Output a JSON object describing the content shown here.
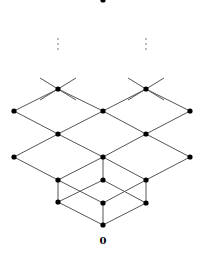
{
  "diagram": {
    "type": "hasse-lattice",
    "bottom_label": "0",
    "nodes": [
      {
        "id": "top",
        "x": 103,
        "y": 0
      },
      {
        "id": "a1",
        "x": 58,
        "y": 89
      },
      {
        "id": "a2",
        "x": 146,
        "y": 89
      },
      {
        "id": "b1",
        "x": 14,
        "y": 111
      },
      {
        "id": "b2",
        "x": 103,
        "y": 111
      },
      {
        "id": "b3",
        "x": 190,
        "y": 111
      },
      {
        "id": "c1",
        "x": 58,
        "y": 134
      },
      {
        "id": "c2",
        "x": 146,
        "y": 134
      },
      {
        "id": "d1",
        "x": 14,
        "y": 157
      },
      {
        "id": "d2",
        "x": 103,
        "y": 157
      },
      {
        "id": "d3",
        "x": 190,
        "y": 157
      },
      {
        "id": "e1",
        "x": 58,
        "y": 180
      },
      {
        "id": "e2",
        "x": 103,
        "y": 180
      },
      {
        "id": "e3",
        "x": 146,
        "y": 180
      },
      {
        "id": "f1",
        "x": 58,
        "y": 202
      },
      {
        "id": "f2",
        "x": 103,
        "y": 203
      },
      {
        "id": "f3",
        "x": 146,
        "y": 203
      },
      {
        "id": "zero",
        "x": 103,
        "y": 225
      }
    ],
    "edges": [
      [
        40,
        78,
        76,
        100
      ],
      [
        76,
        78,
        40,
        100
      ],
      [
        128,
        78,
        164,
        100
      ],
      [
        164,
        78,
        128,
        100
      ],
      [
        58,
        89,
        14,
        111
      ],
      [
        58,
        89,
        103,
        111
      ],
      [
        146,
        89,
        103,
        111
      ],
      [
        146,
        89,
        190,
        111
      ],
      [
        14,
        111,
        58,
        134
      ],
      [
        103,
        111,
        58,
        134
      ],
      [
        103,
        111,
        146,
        134
      ],
      [
        190,
        111,
        146,
        134
      ],
      [
        58,
        134,
        14,
        157
      ],
      [
        58,
        134,
        103,
        157
      ],
      [
        146,
        134,
        103,
        157
      ],
      [
        146,
        134,
        190,
        157
      ],
      [
        14,
        157,
        58,
        180
      ],
      [
        103,
        157,
        58,
        180
      ],
      [
        103,
        157,
        146,
        180
      ],
      [
        103,
        157,
        103,
        180
      ],
      [
        190,
        157,
        146,
        180
      ],
      [
        58,
        180,
        58,
        202
      ],
      [
        146,
        180,
        146,
        203
      ],
      [
        103,
        180,
        58,
        202
      ],
      [
        103,
        180,
        146,
        203
      ],
      [
        58,
        180,
        103,
        203
      ],
      [
        146,
        180,
        103,
        203
      ],
      [
        58,
        202,
        103,
        225
      ],
      [
        146,
        203,
        103,
        225
      ],
      [
        103,
        203,
        103,
        225
      ]
    ],
    "ellipsis_columns": [
      58,
      146
    ],
    "ellipsis_y": [
      39,
      44,
      49
    ]
  }
}
